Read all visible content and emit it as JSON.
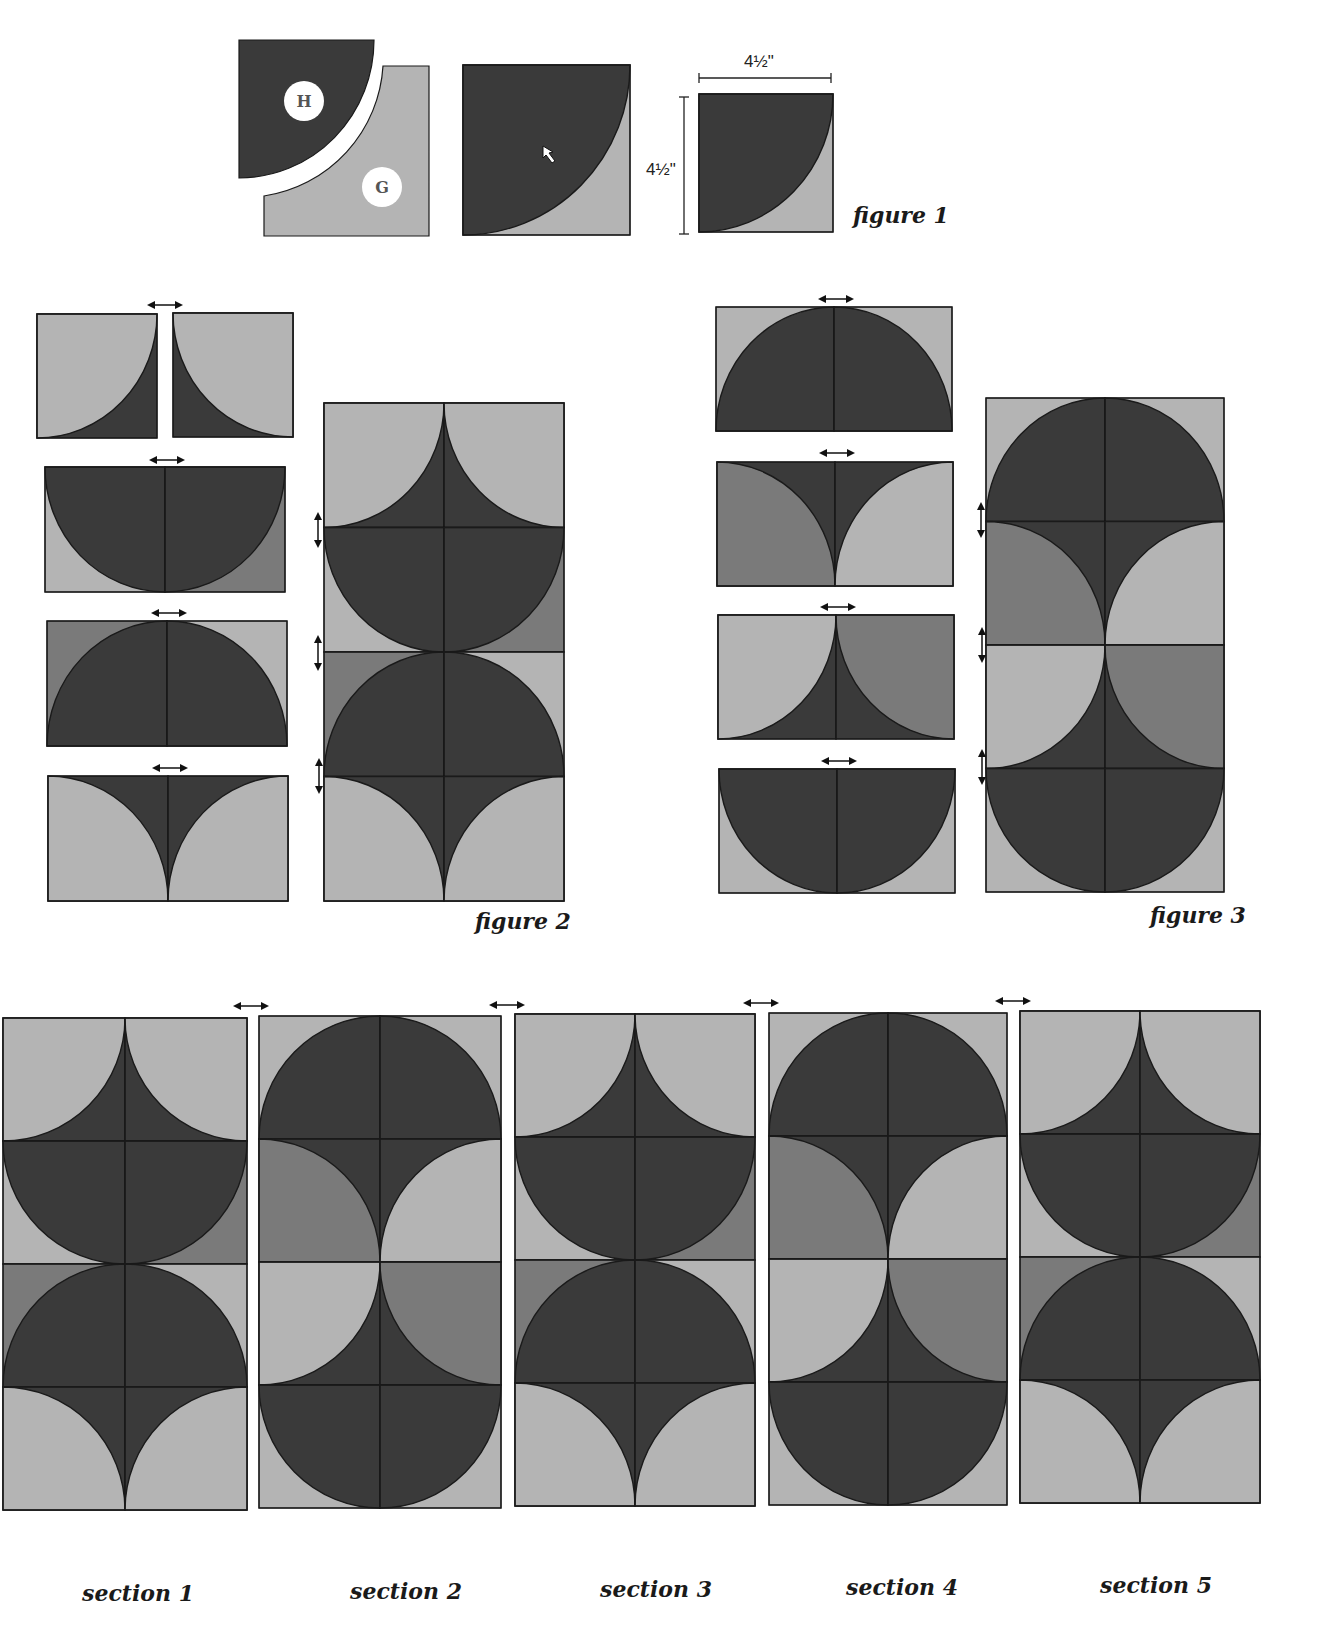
{
  "colors": {
    "dark": "#3a3a3a",
    "darker": "#333333",
    "medium": "#7a7a7a",
    "light": "#b4b4b4",
    "lighter": "#bdbdbd",
    "stroke": "#1a1a1a",
    "background": "#ffffff"
  },
  "figure1": {
    "label": "figure 1",
    "piece_h_label": "H",
    "piece_g_label": "G",
    "width_dim": "4½\"",
    "height_dim": "4½\""
  },
  "figure2": {
    "label": "figure 2"
  },
  "figure3": {
    "label": "figure 3"
  },
  "sections": [
    {
      "label": "section 1",
      "pattern": "A"
    },
    {
      "label": "section 2",
      "pattern": "B"
    },
    {
      "label": "section 3",
      "pattern": "A"
    },
    {
      "label": "section 4",
      "pattern": "B"
    },
    {
      "label": "section 5",
      "pattern": "A"
    }
  ],
  "tile_rows": {
    "A": [
      [
        [
          "tl",
          "L",
          "D"
        ],
        [
          "tr",
          "L",
          "D"
        ]
      ],
      [
        [
          "tr",
          "D",
          "L"
        ],
        [
          "tl",
          "D",
          "M"
        ]
      ],
      [
        [
          "br",
          "D",
          "M"
        ],
        [
          "bl",
          "D",
          "L"
        ]
      ],
      [
        [
          "bl",
          "L",
          "D"
        ],
        [
          "br",
          "L",
          "D"
        ]
      ]
    ],
    "B": [
      [
        [
          "br",
          "D",
          "L"
        ],
        [
          "bl",
          "D",
          "L"
        ]
      ],
      [
        [
          "bl",
          "M",
          "D"
        ],
        [
          "br",
          "L",
          "D"
        ]
      ],
      [
        [
          "tl",
          "L",
          "D"
        ],
        [
          "tr",
          "M",
          "D"
        ]
      ],
      [
        [
          "tr",
          "D",
          "L"
        ],
        [
          "tl",
          "D",
          "L"
        ]
      ]
    ]
  }
}
